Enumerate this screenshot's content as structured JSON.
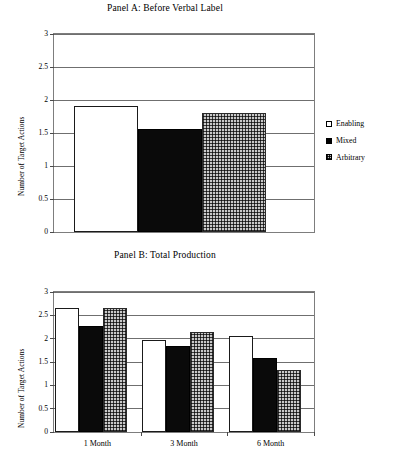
{
  "figure": {
    "series_names": [
      "Enabling",
      "Mixed",
      "Arbitrary"
    ],
    "ylabel": "Number of Target Actions"
  },
  "legend": {
    "enabling": "Enabling",
    "mixed": "Mixed",
    "arbitrary": "Arbitrary",
    "icons": {
      "enabling": "hollow-square-icon",
      "mixed": "filled-square-icon",
      "arbitrary": "crosshatch-square-icon"
    }
  },
  "chart_data": [
    {
      "type": "bar",
      "title": "Panel A: Before Verbal Label",
      "xlabel": "",
      "ylabel": "Number of Target Actions",
      "ylim": [
        0,
        3
      ],
      "yticks": [
        "0",
        "0.5",
        "1",
        "1.5",
        "2",
        "2.5",
        "3"
      ],
      "ytick_values": [
        0,
        0.5,
        1,
        1.5,
        2,
        2.5,
        3
      ],
      "grid": true,
      "legend_position": "right",
      "categories": [
        ""
      ],
      "series": [
        {
          "name": "Enabling",
          "values": [
            1.91
          ]
        },
        {
          "name": "Mixed",
          "values": [
            1.56
          ]
        },
        {
          "name": "Arbitrary",
          "values": [
            1.81
          ]
        }
      ]
    },
    {
      "type": "bar",
      "title": "Panel B: Total Production",
      "xlabel": "",
      "ylabel": "Number of Target Actions",
      "ylim": [
        0,
        3
      ],
      "yticks": [
        "0",
        "0.5",
        "1",
        "1.5",
        "2",
        "2.5",
        "3"
      ],
      "ytick_values": [
        0,
        0.5,
        1,
        1.5,
        2,
        2.5,
        3
      ],
      "grid": true,
      "legend_position": "right",
      "categories": [
        "1 Month",
        "3 Month",
        "6 Month"
      ],
      "series": [
        {
          "name": "Enabling",
          "values": [
            2.66,
            1.97,
            2.06
          ]
        },
        {
          "name": "Mixed",
          "values": [
            2.27,
            1.85,
            1.58
          ]
        },
        {
          "name": "Arbitrary",
          "values": [
            2.66,
            2.14,
            1.33
          ]
        }
      ]
    }
  ]
}
